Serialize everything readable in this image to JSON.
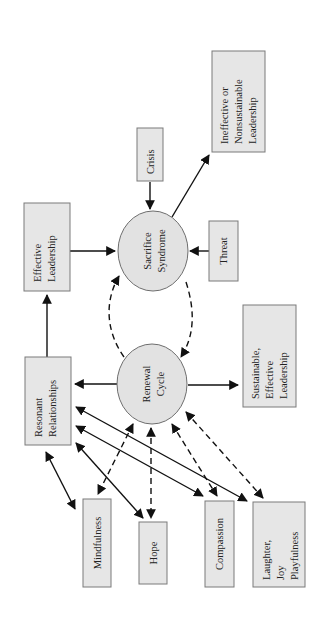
{
  "diagram": {
    "orientation": "rotated 90 degrees counter-clockwise",
    "nodes": {
      "ineffective": {
        "lines": [
          "Ineffective or",
          "Nonsustainable",
          "Leadership"
        ]
      },
      "crisis": {
        "lines": [
          "Crisis"
        ]
      },
      "effective": {
        "lines": [
          "Effective",
          "Leadership"
        ]
      },
      "sacrifice": {
        "lines": [
          "Sacrifice",
          "Syndrome"
        ]
      },
      "threat": {
        "lines": [
          "Threat"
        ]
      },
      "sustainable": {
        "lines": [
          "Sustainable,",
          "Effective",
          "Leadership"
        ]
      },
      "resonant": {
        "lines": [
          "Resonant",
          "Relationships"
        ]
      },
      "renewal": {
        "lines": [
          "Renewal",
          "Cycle"
        ]
      },
      "mindfulness": {
        "lines": [
          "Mindfulness"
        ]
      },
      "hope": {
        "lines": [
          "Hope"
        ]
      },
      "compassion": {
        "lines": [
          "Compassion"
        ]
      },
      "laughter": {
        "lines": [
          "Laughter,",
          "Joy",
          "Playfulness"
        ]
      }
    },
    "edges": [
      {
        "from": "crisis",
        "to": "sacrifice",
        "style": "solid"
      },
      {
        "from": "threat",
        "to": "sacrifice",
        "style": "solid"
      },
      {
        "from": "effective",
        "to": "sacrifice",
        "style": "solid"
      },
      {
        "from": "sacrifice",
        "to": "ineffective",
        "style": "solid"
      },
      {
        "from": "resonant",
        "to": "effective",
        "style": "solid"
      },
      {
        "from": "renewal",
        "to": "resonant",
        "style": "solid"
      },
      {
        "from": "renewal",
        "to": "sustainable",
        "style": "solid"
      },
      {
        "from": "renewal",
        "to": "sacrifice",
        "style": "dashed"
      },
      {
        "from": "sacrifice",
        "to": "renewal",
        "style": "dashed"
      },
      {
        "from": "resonant",
        "to": "mindfulness",
        "style": "solid",
        "bidirectional": true
      },
      {
        "from": "resonant",
        "to": "hope",
        "style": "solid",
        "bidirectional": true
      },
      {
        "from": "resonant",
        "to": "compassion",
        "style": "solid",
        "bidirectional": true
      },
      {
        "from": "resonant",
        "to": "laughter",
        "style": "solid",
        "bidirectional": true
      },
      {
        "from": "renewal",
        "to": "mindfulness",
        "style": "dashed",
        "bidirectional": true
      },
      {
        "from": "renewal",
        "to": "hope",
        "style": "dashed",
        "bidirectional": true
      },
      {
        "from": "renewal",
        "to": "compassion",
        "style": "dashed",
        "bidirectional": true
      },
      {
        "from": "renewal",
        "to": "laughter",
        "style": "dashed",
        "bidirectional": true
      }
    ]
  }
}
